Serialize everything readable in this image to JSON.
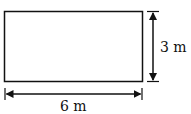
{
  "diagram": {
    "shape": "rectangle",
    "width_label": "6 m",
    "height_label": "3 m",
    "stroke_color": "#111111",
    "background": "#ffffff"
  }
}
